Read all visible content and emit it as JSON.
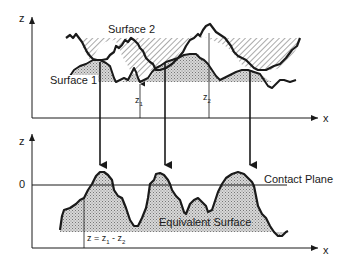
{
  "top_panel": {
    "axis_z_label": "z",
    "axis_x_label": "x",
    "surface2_label": "Surface 2",
    "surface1_label": "Surface 1",
    "z1_label": "z",
    "z1_sub": "1",
    "z2_label": "z",
    "z2_sub": "2"
  },
  "bottom_panel": {
    "axis_z_label": "z",
    "axis_x_label": "x",
    "zero_label": "0",
    "contact_plane_label": "Contact Plane",
    "equivalent_surface_label": "Equivalent Surface",
    "formula_prefix": "z = z",
    "formula_sub1": "1",
    "formula_mid": " - z",
    "formula_sub2": "2"
  },
  "colors": {
    "line": "#1a1a1a",
    "hatch": "#555555",
    "stipple": "#b0b0b0",
    "background": "#ffffff"
  }
}
